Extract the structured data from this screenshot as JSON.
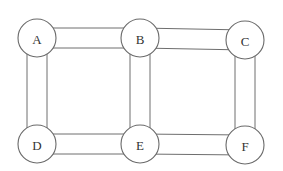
{
  "diagram": {
    "type": "graph",
    "nodes": [
      {
        "id": "A",
        "label": "A",
        "x": 37,
        "y": 38
      },
      {
        "id": "B",
        "label": "B",
        "x": 140,
        "y": 38
      },
      {
        "id": "C",
        "label": "C",
        "x": 245,
        "y": 40
      },
      {
        "id": "D",
        "label": "D",
        "x": 37,
        "y": 144
      },
      {
        "id": "E",
        "label": "E",
        "x": 140,
        "y": 144
      },
      {
        "id": "F",
        "label": "F",
        "x": 245,
        "y": 145
      }
    ],
    "edges": [
      {
        "from": "A",
        "to": "B"
      },
      {
        "from": "B",
        "to": "C"
      },
      {
        "from": "A",
        "to": "D"
      },
      {
        "from": "B",
        "to": "E"
      },
      {
        "from": "C",
        "to": "F"
      },
      {
        "from": "D",
        "to": "E"
      },
      {
        "from": "E",
        "to": "F"
      }
    ],
    "node_radius": 19,
    "edge_width": 20,
    "colors": {
      "stroke": "#6e6e6e",
      "text": "#333333",
      "background": "#ffffff"
    }
  }
}
